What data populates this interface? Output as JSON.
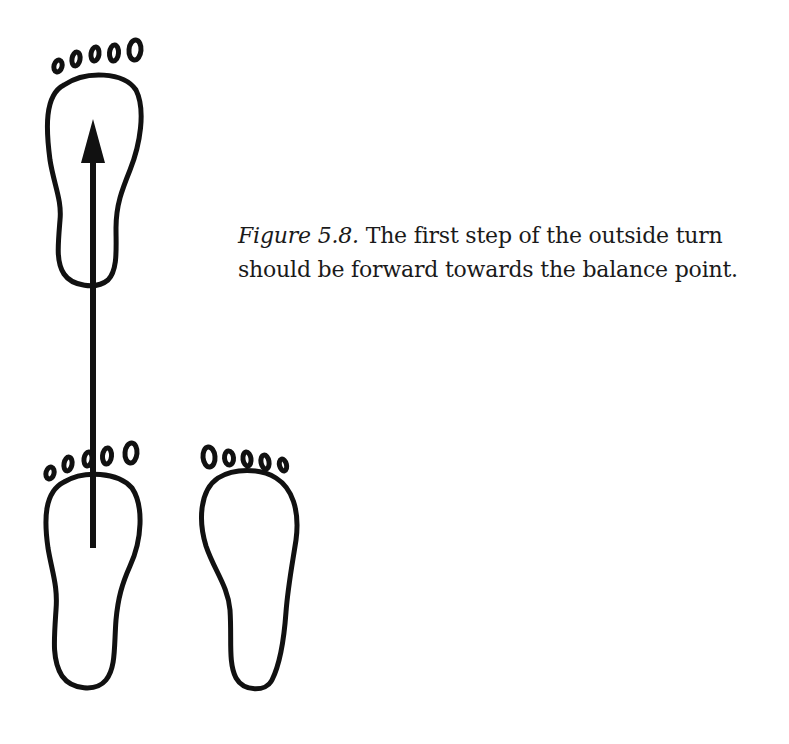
{
  "figure": {
    "label": "Figure 5.8.",
    "caption_line1": " The first step of the outside turn",
    "caption_line2": "should be forward towards the balance point.",
    "ink_color": "#111111",
    "background_color": "#ffffff",
    "footprints": [
      {
        "id": "front-left-foot",
        "toes": 5,
        "description": "stepped-forward foot"
      },
      {
        "id": "rear-left-foot",
        "toes": 5,
        "description": "starting left foot"
      },
      {
        "id": "rear-right-foot",
        "toes": 5,
        "description": "starting right foot"
      }
    ],
    "arrow": {
      "direction": "up",
      "description": "forward step toward balance point"
    }
  }
}
